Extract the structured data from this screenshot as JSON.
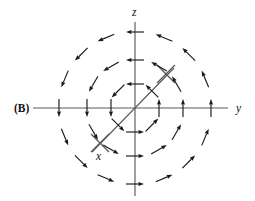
{
  "figure": {
    "panel_label": "(B)",
    "caption_note": "",
    "background_color": "#ffffff",
    "axis_color": "#5a5a5a",
    "vector_color": "#1a1a1a"
  },
  "axes": [
    {
      "name": "z-axis",
      "label": "z",
      "orientation": "vertical",
      "label_x": 132,
      "label_y": 16
    },
    {
      "name": "y-axis",
      "label": "y",
      "orientation": "horizontal",
      "label_x": 236,
      "label_y": 112
    },
    {
      "name": "x-axis",
      "label": "x",
      "orientation": "diagonal",
      "label_x": 96,
      "label_y": 160
    }
  ],
  "chart_data": {
    "type": "scatter",
    "title": "",
    "xlabel": "y",
    "ylabel": "z",
    "origin": {
      "x": 135,
      "y": 108
    },
    "axis_extents": {
      "z_top": 22,
      "z_bottom": 196,
      "y_left": 33,
      "y_right": 228,
      "x_diag_start": {
        "x": 92,
        "y": 152
      },
      "x_diag_end": {
        "x": 174,
        "y": 68
      }
    },
    "x_axis_ticks": [
      {
        "cx": 100,
        "cy": 143,
        "size": 9
      },
      {
        "cx": 166,
        "cy": 74,
        "size": 9
      }
    ],
    "rings": [
      {
        "name": "inner-ring",
        "radius": 24,
        "count": 8,
        "phase_deg": 0
      },
      {
        "name": "middle-ring",
        "radius": 48,
        "count": 12,
        "phase_deg": 0
      },
      {
        "name": "outer-ring",
        "radius": 76,
        "count": 16,
        "phase_deg": 0
      }
    ],
    "arrow_length": 18,
    "arrow_head_len": 5.5,
    "arrow_head_width": 4.0,
    "circulation": "counterclockwise-about-x"
  }
}
